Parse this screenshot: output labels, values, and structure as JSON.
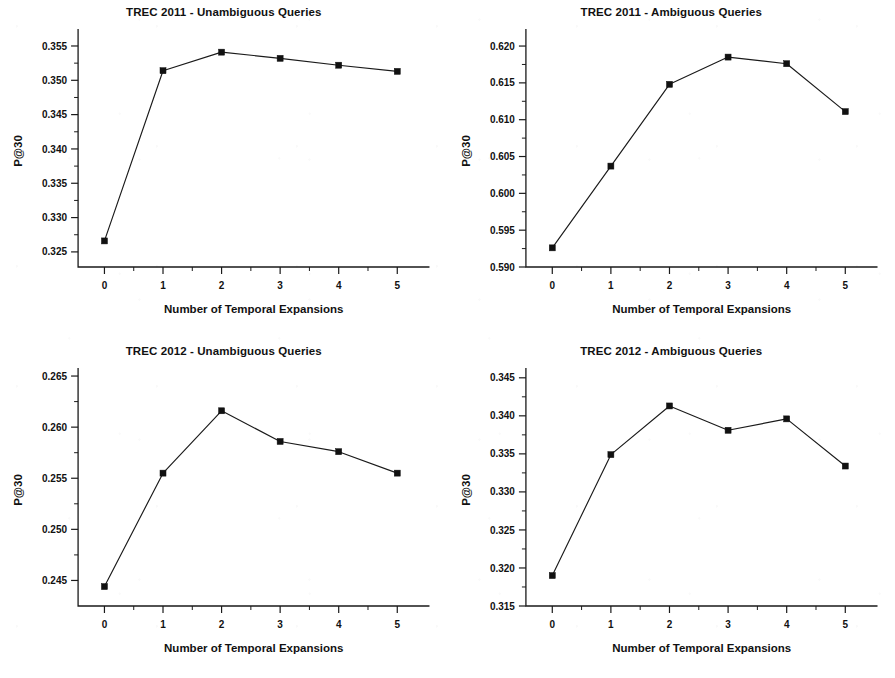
{
  "figure": {
    "layout": "2x2 grid of line charts",
    "background_color": "#ffffff",
    "ink_color": "#111111"
  },
  "chart_data": [
    {
      "type": "line",
      "title": "TREC 2011 - Unambiguous Queries",
      "xlabel": "Number of Temporal Expansions",
      "ylabel": "P@30",
      "x": [
        0,
        1,
        2,
        3,
        4,
        5
      ],
      "values": [
        0.3266,
        0.3514,
        0.3541,
        0.3532,
        0.3522,
        0.3513
      ],
      "xticklabels": [
        "0",
        "1",
        "2",
        "3",
        "4",
        "5"
      ],
      "yticklabels": [
        "0.325",
        "0.330",
        "0.335",
        "0.340",
        "0.345",
        "0.350",
        "0.355"
      ],
      "yticks": [
        0.325,
        0.33,
        0.335,
        0.34,
        0.345,
        0.35,
        0.355
      ],
      "xlim": [
        -0.45,
        5.55
      ],
      "ylim": [
        0.3228,
        0.3566
      ],
      "grid": false,
      "legend": "none",
      "marker": "filled-square"
    },
    {
      "type": "line",
      "title": "TREC 2011 - Ambiguous Queries",
      "xlabel": "Number of Temporal Expansions",
      "ylabel": "P@30",
      "x": [
        0,
        1,
        2,
        3,
        4,
        5
      ],
      "values": [
        0.5926,
        0.6037,
        0.6148,
        0.6185,
        0.6176,
        0.6111
      ],
      "xticklabels": [
        "0",
        "1",
        "2",
        "3",
        "4",
        "5"
      ],
      "yticklabels": [
        "0.590",
        "0.595",
        "0.600",
        "0.605",
        "0.610",
        "0.615",
        "0.620"
      ],
      "yticks": [
        0.59,
        0.595,
        0.6,
        0.605,
        0.61,
        0.615,
        0.62
      ],
      "xlim": [
        -0.45,
        5.55
      ],
      "ylim": [
        0.59,
        0.6215
      ],
      "grid": false,
      "legend": "none",
      "marker": "filled-square"
    },
    {
      "type": "line",
      "title": "TREC 2012 - Unambiguous Queries",
      "xlabel": "Number of Temporal Expansions",
      "ylabel": "P@30",
      "x": [
        0,
        1,
        2,
        3,
        4,
        5
      ],
      "values": [
        0.2444,
        0.2555,
        0.2616,
        0.2586,
        0.2576,
        0.2555
      ],
      "xticklabels": [
        "0",
        "1",
        "2",
        "3",
        "4",
        "5"
      ],
      "yticklabels": [
        "0.245",
        "0.250",
        "0.255",
        "0.260",
        "0.265"
      ],
      "yticks": [
        0.245,
        0.25,
        0.255,
        0.26,
        0.265
      ],
      "xlim": [
        -0.45,
        5.55
      ],
      "ylim": [
        0.2425,
        0.2652
      ],
      "grid": false,
      "legend": "none",
      "marker": "filled-square"
    },
    {
      "type": "line",
      "title": "TREC 2012 - Ambiguous Queries",
      "xlabel": "Number of Temporal Expansions",
      "ylabel": "P@30",
      "x": [
        0,
        1,
        2,
        3,
        4,
        5
      ],
      "values": [
        0.319,
        0.3349,
        0.3413,
        0.3381,
        0.3396,
        0.3334
      ],
      "xticklabels": [
        "0",
        "1",
        "2",
        "3",
        "4",
        "5"
      ],
      "yticklabels": [
        "0.315",
        "0.320",
        "0.325",
        "0.330",
        "0.335",
        "0.340",
        "0.345"
      ],
      "yticks": [
        0.315,
        0.32,
        0.325,
        0.33,
        0.335,
        0.34,
        0.345
      ],
      "xlim": [
        -0.45,
        5.55
      ],
      "ylim": [
        0.315,
        0.3455
      ],
      "grid": false,
      "legend": "none",
      "marker": "filled-square"
    }
  ]
}
